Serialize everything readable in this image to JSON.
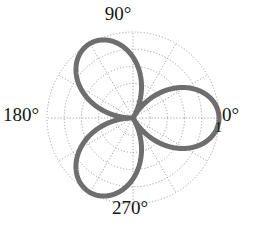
{
  "figure": {
    "kind": "polar-plot",
    "background_color": "#ffffff",
    "curve_color": "#6e6e6e",
    "grid_color": "#9a9a9a",
    "text_color": "#141414"
  },
  "angle_labels": [
    {
      "name": "0",
      "text": "0°"
    },
    {
      "name": "90",
      "text": "90°"
    },
    {
      "name": "180",
      "text": "180°"
    },
    {
      "name": "270",
      "text": "270°"
    }
  ],
  "radial_labels": [
    {
      "name": "r-max",
      "text": "1"
    }
  ],
  "chart_data": {
    "type": "line",
    "subtype": "polar-rose",
    "title": "",
    "xlabel": "",
    "ylabel": "",
    "projection": "polar",
    "equation": "r = |cos(1.5θ)|",
    "petal_count": 3,
    "petal_angles_deg": [
      0,
      120,
      240
    ],
    "petal_peak_radius": 1,
    "rlim": [
      0,
      1
    ],
    "rticks": [
      0.2,
      0.4,
      0.6,
      0.8,
      1
    ],
    "rtick_labels": [
      "",
      "",
      "",
      "",
      "1"
    ],
    "theta_ticks_deg": [
      0,
      30,
      60,
      90,
      120,
      150,
      180,
      210,
      240,
      270,
      300,
      330
    ],
    "theta_tick_labels": [
      "0°",
      "",
      "",
      "90°",
      "",
      "",
      "180°",
      "",
      "",
      "270°",
      "",
      ""
    ],
    "theta_direction": "counterclockwise",
    "theta_zero_location": "E",
    "grid": true,
    "grid_style": "dotted",
    "legend": false,
    "series": [
      {
        "name": "r = |cos(1.5θ)|",
        "color": "#6e6e6e",
        "linewidth": 5,
        "theta_deg": [
          0,
          5,
          10,
          15,
          20,
          25,
          30,
          35,
          40,
          45,
          50,
          55,
          60,
          65,
          70,
          75,
          80,
          85,
          90,
          95,
          100,
          105,
          110,
          115,
          120,
          125,
          130,
          135,
          140,
          145,
          150,
          155,
          160,
          165,
          170,
          175,
          180,
          185,
          190,
          195,
          200,
          205,
          210,
          215,
          220,
          225,
          230,
          235,
          240,
          245,
          250,
          255,
          260,
          265,
          270,
          275,
          280,
          285,
          290,
          295,
          300,
          305,
          310,
          315,
          320,
          325,
          330,
          335,
          340,
          345,
          350,
          355,
          360
        ],
        "r": [
          1.0,
          0.991,
          0.966,
          0.924,
          0.866,
          0.793,
          0.707,
          0.609,
          0.5,
          0.383,
          0.259,
          0.131,
          0.0,
          0.131,
          0.259,
          0.383,
          0.5,
          0.609,
          0.707,
          0.793,
          0.866,
          0.924,
          0.966,
          0.991,
          1.0,
          0.991,
          0.966,
          0.924,
          0.866,
          0.793,
          0.707,
          0.609,
          0.5,
          0.383,
          0.259,
          0.131,
          0.0,
          0.131,
          0.259,
          0.383,
          0.5,
          0.609,
          0.707,
          0.793,
          0.866,
          0.924,
          0.966,
          0.991,
          1.0,
          0.991,
          0.966,
          0.924,
          0.866,
          0.793,
          0.707,
          0.609,
          0.5,
          0.383,
          0.259,
          0.131,
          0.0,
          0.131,
          0.259,
          0.383,
          0.5,
          0.609,
          0.707,
          0.793,
          0.866,
          0.924,
          0.966,
          0.991,
          1.0
        ]
      }
    ]
  }
}
